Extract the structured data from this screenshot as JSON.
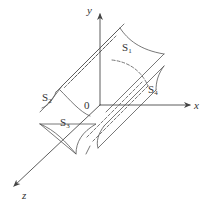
{
  "figure": {
    "axes": {
      "x_label": "x",
      "y_label": "y",
      "z_label": "z",
      "origin_label": "0"
    },
    "surfaces": [
      {
        "id": "S1",
        "base": "S",
        "sub": "1"
      },
      {
        "id": "S2",
        "base": "S",
        "sub": "2"
      },
      {
        "id": "S3",
        "base": "S",
        "sub": "3"
      },
      {
        "id": "S4",
        "base": "S",
        "sub": "4"
      }
    ],
    "colors": {
      "stroke": "#555555",
      "background": "#ffffff"
    }
  }
}
